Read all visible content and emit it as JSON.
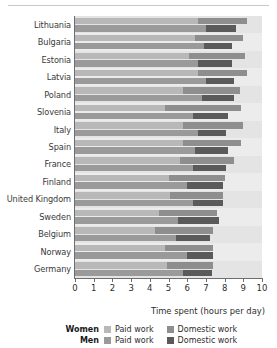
{
  "chart_data": {
    "type": "bar",
    "subtype": "grouped-stacked-horizontal-bar",
    "title": "",
    "xlabel": "Time spent  (hours per day)",
    "ylabel": "",
    "xlim": [
      0,
      10
    ],
    "xticks": [
      "0",
      "1",
      "2",
      "3",
      "4",
      "5",
      "6",
      "7",
      "8",
      "9",
      "10"
    ],
    "grid": false,
    "legend_position": "bottom",
    "orientation": "horizontal",
    "categories": [
      "Lithuania",
      "Bulgaria",
      "Estonia",
      "Latvia",
      "Poland",
      "Slovenia",
      "Italy",
      "Spain",
      "France",
      "Finland",
      "United Kingdom",
      "Sweden",
      "Belgium",
      "Norway",
      "Germany"
    ],
    "series": [
      {
        "name": "Women Paid work",
        "group": "Women",
        "component": "Paid work",
        "color": "#b8b8b8",
        "values": [
          6.6,
          6.4,
          6.1,
          6.6,
          5.8,
          4.8,
          5.8,
          5.8,
          5.6,
          5.0,
          5.1,
          4.5,
          4.3,
          4.8,
          4.9
        ]
      },
      {
        "name": "Women Domestic work",
        "group": "Women",
        "component": "Domestic work",
        "color": "#8e8e8e",
        "values": [
          2.6,
          2.6,
          3.0,
          2.6,
          3.0,
          4.1,
          3.2,
          3.1,
          2.9,
          3.0,
          2.8,
          3.1,
          3.1,
          2.6,
          2.5
        ]
      },
      {
        "name": "Men Paid work",
        "group": "Men",
        "component": "Paid work",
        "color": "#9a9a9a",
        "values": [
          7.0,
          6.9,
          6.6,
          7.0,
          6.8,
          6.3,
          6.6,
          6.4,
          6.3,
          6.0,
          6.3,
          5.5,
          5.4,
          6.0,
          5.8
        ]
      },
      {
        "name": "Men Domestic work",
        "group": "Men",
        "component": "Domestic work",
        "color": "#5a5a5a",
        "values": [
          1.6,
          1.5,
          1.8,
          1.5,
          1.7,
          1.9,
          1.5,
          1.8,
          1.8,
          1.9,
          1.6,
          2.2,
          1.8,
          1.4,
          1.5
        ]
      }
    ],
    "legend": [
      {
        "gender": "Women",
        "entries": [
          {
            "label": "Paid work",
            "color": "#b8b8b8"
          },
          {
            "label": "Domestic work",
            "color": "#8e8e8e"
          }
        ]
      },
      {
        "gender": "Men",
        "entries": [
          {
            "label": "Paid work",
            "color": "#9a9a9a"
          },
          {
            "label": "Domestic work",
            "color": "#5a5a5a"
          }
        ]
      }
    ]
  }
}
